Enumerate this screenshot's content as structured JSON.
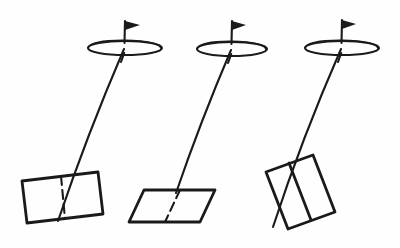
{
  "figure": {
    "title": "Three pendulum-canopy diagrams",
    "background_color": "#fefefe",
    "ink_color": "#1a1a1a",
    "canvas": {
      "width": 400,
      "height": 248
    }
  },
  "chart_data": {
    "type": "diagram",
    "title": "Three pendulum-canopy diagrams",
    "xlabel": "",
    "ylabel": "",
    "units": "pixels",
    "items": [
      {
        "name": "assembly-1",
        "label": "Left assembly",
        "canopy": {
          "name": "ellipse-1",
          "cx": 125,
          "cy": 48,
          "rx": 37,
          "ry": 7,
          "pole": {
            "x1": 125,
            "y1": 21,
            "x2": 121,
            "y2": 62
          },
          "flag": {
            "points": "125,21 140,25 125,30"
          }
        },
        "cord": {
          "x1": 124,
          "y1": 49,
          "x2": 58,
          "y2": 221
        },
        "plate": {
          "name": "quad-1",
          "shape": "rectangle-tilted",
          "points": "22,181 98,172 103,214 27,223",
          "divider": {
            "x1": 61,
            "y1": 176,
            "x2": 65,
            "y2": 219,
            "dashed": true
          }
        }
      },
      {
        "name": "assembly-2",
        "label": "Middle assembly",
        "canopy": {
          "name": "ellipse-2",
          "cx": 232,
          "cy": 49,
          "rx": 35,
          "ry": 7,
          "pole": {
            "x1": 232,
            "y1": 21,
            "x2": 228,
            "y2": 63
          },
          "flag": {
            "points": "232,21 246,25 232,30"
          }
        },
        "cord": {
          "x1": 231,
          "y1": 50,
          "x2": 176,
          "y2": 193
        },
        "plate": {
          "name": "quad-2",
          "shape": "parallelogram",
          "points": "144,190 215,190 200,222 129,222",
          "divider": {
            "x1": 180,
            "y1": 190,
            "x2": 165,
            "y2": 222,
            "dashed": true
          }
        }
      },
      {
        "name": "assembly-3",
        "label": "Right assembly",
        "canopy": {
          "name": "ellipse-3",
          "cx": 342,
          "cy": 48,
          "rx": 37,
          "ry": 7,
          "pole": {
            "x1": 342,
            "y1": 20,
            "x2": 338,
            "y2": 62
          },
          "flag": {
            "points": "342,20 356,24 342,29"
          }
        },
        "cord": {
          "x1": 341,
          "y1": 49,
          "x2": 273,
          "y2": 227
        },
        "plate": {
          "name": "quad-3",
          "shape": "rectangle-rotated",
          "points": "266,172 313,155 335,212 288,229",
          "divider": {
            "x1": 289,
            "y1": 163,
            "x2": 311,
            "y2": 220,
            "dashed": false
          }
        }
      }
    ]
  }
}
